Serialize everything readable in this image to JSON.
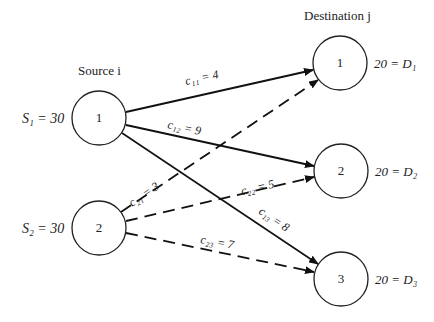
{
  "headers": {
    "source": "Source i",
    "destination": "Destination j"
  },
  "sources": [
    {
      "id": "1",
      "label": "S₁ = 30",
      "supply": 30
    },
    {
      "id": "2",
      "label": "S₂ = 30",
      "supply": 30
    }
  ],
  "destinations": [
    {
      "id": "1",
      "label": "20 = D₁",
      "demand": 20
    },
    {
      "id": "2",
      "label": "20 = D₂",
      "demand": 20
    },
    {
      "id": "3",
      "label": "20 = D₃",
      "demand": 20
    }
  ],
  "edges": [
    {
      "from": "1",
      "to": "1",
      "label": "c₁₁ = 4",
      "style": "solid"
    },
    {
      "from": "1",
      "to": "2",
      "label": "c₁₂ = 9",
      "style": "solid"
    },
    {
      "from": "1",
      "to": "3",
      "label": "c₁₃ = 8",
      "style": "solid"
    },
    {
      "from": "2",
      "to": "1",
      "label": "c₂₁ = 3",
      "style": "dashed"
    },
    {
      "from": "2",
      "to": "2",
      "label": "c₂₂ = 5",
      "style": "dashed"
    },
    {
      "from": "2",
      "to": "3",
      "label": "c₂₃ = 7",
      "style": "dashed"
    }
  ]
}
